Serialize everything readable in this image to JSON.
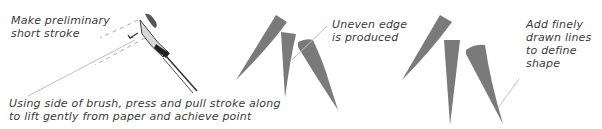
{
  "annotations": {
    "preliminary": [
      "Make preliminary",
      "short stroke"
    ],
    "technique": [
      "Using side of brush, press and pull stroke along",
      "to lift gently from paper and achieve point"
    ],
    "uneven": [
      "Uneven edge",
      "is produced"
    ],
    "fine_lines": [
      "Add finely",
      "drawn lines",
      "to define",
      "shape"
    ]
  },
  "colors": {
    "stroke_grey": "#7a7a7a",
    "text": "#3a3a3a",
    "leader_line": "#b5b5b5"
  }
}
